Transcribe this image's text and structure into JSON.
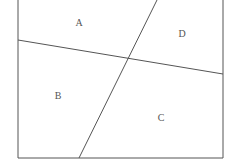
{
  "diagram": {
    "stroke_color": "#555555",
    "frame": {
      "left": 18,
      "right": 223,
      "bottom": 158,
      "top_open": true
    },
    "lines": [
      {
        "name": "horizontal-ish",
        "x1": 18,
        "y1": 40,
        "x2": 223,
        "y2": 74
      },
      {
        "name": "slanted",
        "x1": 157,
        "y1": 0,
        "x2": 79,
        "y2": 158
      }
    ],
    "intersection": {
      "x": 129,
      "y": 58
    },
    "regions": [
      {
        "label": "A",
        "x": 79,
        "y": 26
      },
      {
        "label": "B",
        "x": 58,
        "y": 99
      },
      {
        "label": "C",
        "x": 161,
        "y": 121
      },
      {
        "label": "D",
        "x": 182,
        "y": 37
      }
    ]
  }
}
